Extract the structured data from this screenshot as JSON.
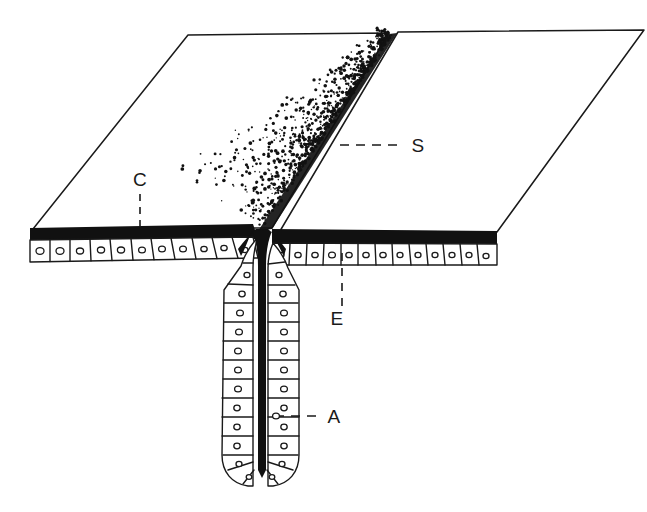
{
  "figure": {
    "background_color": "#ffffff",
    "ink_color": "#1a1a1a",
    "width": 647,
    "height": 512
  },
  "labels": [
    {
      "key": "C",
      "text": "C",
      "meaning": "cuticle",
      "x": 140,
      "y": 186,
      "leader": {
        "style": "dashed-vertical",
        "x1": 140,
        "y1": 194,
        "x2": 140,
        "y2": 231
      }
    },
    {
      "key": "S",
      "text": "S",
      "meaning": "secretion",
      "x": 418,
      "y": 152,
      "leader": {
        "style": "dashed-horizontal",
        "x1": 340,
        "y1": 145,
        "x2": 404,
        "y2": 145
      }
    },
    {
      "key": "E",
      "text": "E",
      "meaning": "epidermis",
      "x": 337,
      "y": 325,
      "leader": {
        "style": "dashed-vertical",
        "x1": 342,
        "y1": 253,
        "x2": 342,
        "y2": 307
      }
    },
    {
      "key": "A",
      "text": "A",
      "meaning": "gland cell nucleus",
      "x": 334,
      "y": 423,
      "leader": {
        "style": "dashed-horizontal",
        "x1": 275,
        "y1": 416,
        "x2": 322,
        "y2": 416
      }
    }
  ],
  "regions": {
    "left_block_top": "upper cuticle surface, left of the gland opening",
    "right_block_top": "upper cuticle surface, right of the gland opening",
    "cuticle_layer": "thick black cuticle band across the cut face",
    "epidermis_left": "row of columnar epidermal cells left of the duct",
    "epidermis_right": "row of columnar epidermal cells right of the duct",
    "gland_duct": "invaginated duct of columnar gland cells with dark central lumen",
    "secretion_plume": "stippled secretion spreading over the cuticle surface"
  },
  "counts": {
    "epidermal_cells_left": 11,
    "epidermal_cells_right": 13,
    "duct_cells_left": 13,
    "duct_cells_right": 13,
    "stipple_dots": 1500
  }
}
